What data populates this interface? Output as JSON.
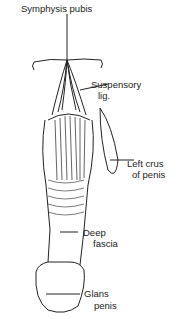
{
  "labels": {
    "symphysis": "Symphysis pubis",
    "suspensory_1": "Suspensory",
    "suspensory_2": "lig.",
    "crus_1": "Left crus",
    "crus_2": "of penis",
    "fascia_1": "Deep",
    "fascia_2": "fascia",
    "glans_1": "Glans",
    "glans_2": "penis"
  }
}
